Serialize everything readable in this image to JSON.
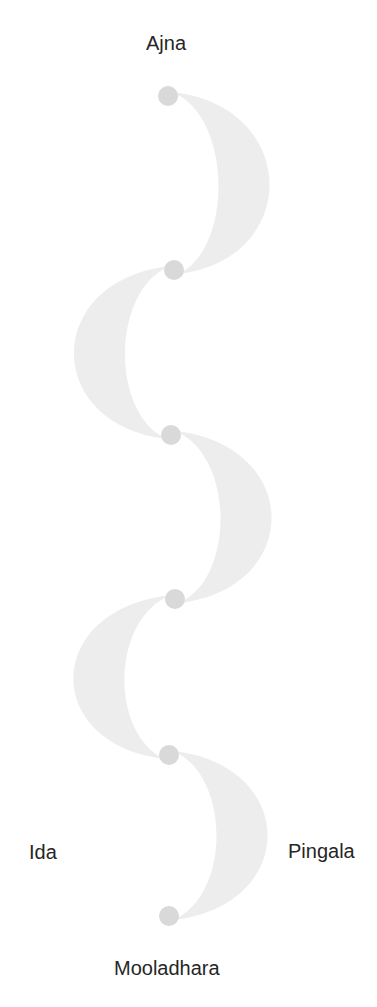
{
  "diagram": {
    "labels": {
      "top": "Ajna",
      "bottom": "Mooladhara",
      "left": "Ida",
      "right": "Pingala"
    },
    "colors": {
      "node": "#d9d9d9",
      "crescent": "#ededed",
      "text": "#262626",
      "background": "#ffffff"
    },
    "nodes": [
      {
        "id": "node-1",
        "x": 168,
        "y": 96,
        "r": 10
      },
      {
        "id": "node-2",
        "x": 174,
        "y": 270,
        "r": 10
      },
      {
        "id": "node-3",
        "x": 171,
        "y": 435,
        "r": 10
      },
      {
        "id": "node-4",
        "x": 175,
        "y": 599,
        "r": 10
      },
      {
        "id": "node-5",
        "x": 169,
        "y": 755,
        "r": 10
      },
      {
        "id": "node-6",
        "x": 169,
        "y": 916,
        "r": 10
      }
    ],
    "crescents": [
      {
        "from": 0,
        "to": 1,
        "side": "right"
      },
      {
        "from": 1,
        "to": 2,
        "side": "left"
      },
      {
        "from": 2,
        "to": 3,
        "side": "right"
      },
      {
        "from": 3,
        "to": 4,
        "side": "left"
      },
      {
        "from": 4,
        "to": 5,
        "side": "right"
      }
    ]
  }
}
